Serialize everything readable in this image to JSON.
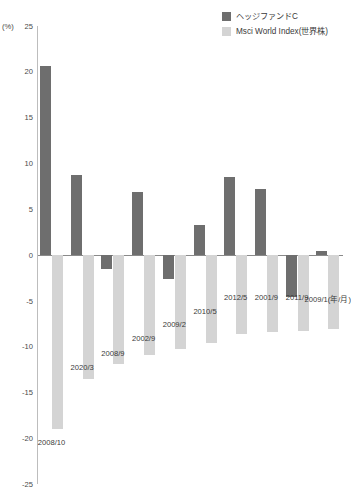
{
  "legend": {
    "items": [
      {
        "label": "ヘッジファンドC",
        "color": "#6e6e6e",
        "key": "hedge-fund-c"
      },
      {
        "label": "Msci World Index(世界株)",
        "color": "#d4d4d4",
        "key": "msci-world-index"
      }
    ]
  },
  "axis": {
    "unit_label": "(%)",
    "y_ticks": [
      "25",
      "20",
      "15",
      "10",
      "5",
      "0",
      "-5",
      "-10",
      "-15",
      "-20",
      "-25"
    ],
    "x_axis_unit": "(年/月)"
  },
  "chart_data": {
    "type": "bar",
    "title": "",
    "xlabel": "(年/月)",
    "ylabel": "(%)",
    "ylim": [
      -25,
      25
    ],
    "ytick_step": 5,
    "grid": false,
    "legend_position": "top-right",
    "categories": [
      "2008/10",
      "2020/3",
      "2008/9",
      "2002/9",
      "2009/2",
      "2010/5",
      "2012/5",
      "2001/9",
      "2011/9",
      "2009/1"
    ],
    "series": [
      {
        "name": "ヘッジファンドC",
        "color": "#6e6e6e",
        "values": [
          20.6,
          8.7,
          -1.5,
          6.8,
          -2.6,
          3.2,
          8.5,
          7.2,
          -4.6,
          0.4
        ]
      },
      {
        "name": "Msci World Index(世界株)",
        "color": "#d4d4d4",
        "values": [
          -19.0,
          -13.5,
          -11.9,
          -10.9,
          -10.3,
          -9.6,
          -8.6,
          -8.4,
          -8.3,
          -8.1
        ]
      }
    ]
  }
}
